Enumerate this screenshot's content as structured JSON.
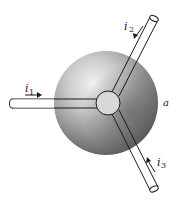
{
  "diagram": {
    "sphere": {
      "label": "a",
      "fill_light": "#e6e6e6",
      "fill_dark": "#5a5a5a"
    },
    "currents": [
      {
        "id": "i1",
        "symbol": "i",
        "subscript": "1",
        "direction": "into sphere (rightward)"
      },
      {
        "id": "i2",
        "symbol": "i",
        "subscript": "2",
        "direction": "into sphere (down-left along wire)"
      },
      {
        "id": "i3",
        "symbol": "i",
        "subscript": "3",
        "direction": "out of sphere (up-left arrow along wire)"
      }
    ],
    "line_color": "#1a1a1a"
  }
}
